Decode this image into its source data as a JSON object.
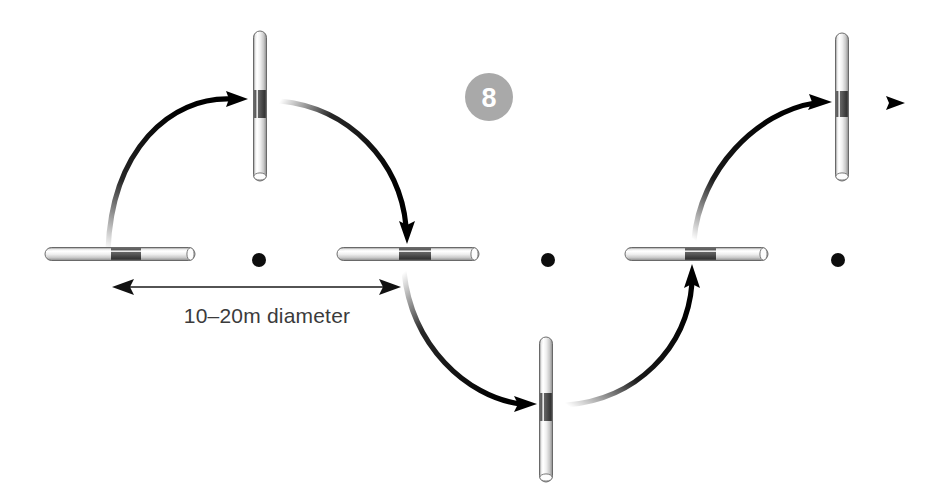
{
  "figure": {
    "title": "",
    "badge": {
      "name": "step-number-badge",
      "value": "8",
      "circle_color": "#a9a9a9",
      "text_color": "#ffffff",
      "cx": 489,
      "cy": 97,
      "r": 24
    },
    "dimension": {
      "name": "diameter-dimension",
      "label": "10–20m diameter",
      "text_color": "#3b3b3b",
      "line_color": "#1a1a1a",
      "x1": 113,
      "x2": 400,
      "y": 287,
      "text_x": 267,
      "text_y": 323
    },
    "colors": {
      "rod_light": "#f2f2f2",
      "rod_edge": "#6f6f6f",
      "rod_band": "#4d4d4d",
      "rod_shine": "#ffffff",
      "dot": "#0d0d0d",
      "arrow": "#000000",
      "background": "#ffffff"
    },
    "rods": [
      {
        "name": "rod-horizontal-1",
        "orientation": "horizontal",
        "x": 45,
        "y": 254,
        "length": 150,
        "thickness": 13,
        "band_start": 0.44,
        "band_end": 0.64
      },
      {
        "name": "rod-vertical-1",
        "orientation": "vertical",
        "x": 254,
        "y": 31,
        "length": 150,
        "thickness": 13,
        "band_start": 0.4,
        "band_end": 0.58
      },
      {
        "name": "rod-horizontal-2",
        "orientation": "horizontal",
        "x": 337,
        "y": 254,
        "length": 142,
        "thickness": 13,
        "band_start": 0.44,
        "band_end": 0.66
      },
      {
        "name": "rod-vertical-2",
        "orientation": "vertical",
        "x": 540,
        "y": 337,
        "length": 145,
        "thickness": 13,
        "band_start": 0.4,
        "band_end": 0.58
      },
      {
        "name": "rod-horizontal-3",
        "orientation": "horizontal",
        "x": 625,
        "y": 254,
        "length": 143,
        "thickness": 13,
        "band_start": 0.42,
        "band_end": 0.64
      },
      {
        "name": "rod-vertical-3",
        "orientation": "vertical",
        "x": 836,
        "y": 33,
        "length": 148,
        "thickness": 13,
        "band_start": 0.4,
        "band_end": 0.56
      }
    ],
    "dots": [
      {
        "name": "pivot-dot-1",
        "cx": 259,
        "cy": 260,
        "r": 7
      },
      {
        "name": "pivot-dot-2",
        "cx": 548,
        "cy": 260,
        "r": 7
      },
      {
        "name": "pivot-dot-3",
        "cx": 838,
        "cy": 260,
        "r": 7
      }
    ],
    "arrows": [
      {
        "name": "arc-arrow-1",
        "kind": "curved",
        "path": "M 108 250 C 112 150 170 95 236 99",
        "description": "arc from first horizontal rod up to first vertical rod"
      },
      {
        "name": "arc-arrow-2",
        "kind": "curved",
        "path": "M 278 100 C 348 106 400 160 406 232",
        "description": "arc from first vertical rod down to second horizontal rod"
      },
      {
        "name": "arc-arrow-3",
        "kind": "curved",
        "path": "M 404 272 C 412 345 465 395 524 404",
        "description": "arc from second horizontal rod down to bottom vertical rod"
      },
      {
        "name": "arc-arrow-4",
        "kind": "curved",
        "path": "M 565 405 C 634 398 686 348 692 277",
        "description": "arc from bottom vertical rod up to third horizontal rod"
      },
      {
        "name": "arc-arrow-5",
        "kind": "curved",
        "path": "M 694 240 C 700 170 755 112 818 103",
        "description": "arc from third horizontal rod up to third vertical rod"
      },
      {
        "name": "exit-arrow",
        "kind": "straight",
        "x1": 862,
        "x2": 903,
        "y": 103,
        "description": "straight arrow exiting right"
      }
    ]
  }
}
